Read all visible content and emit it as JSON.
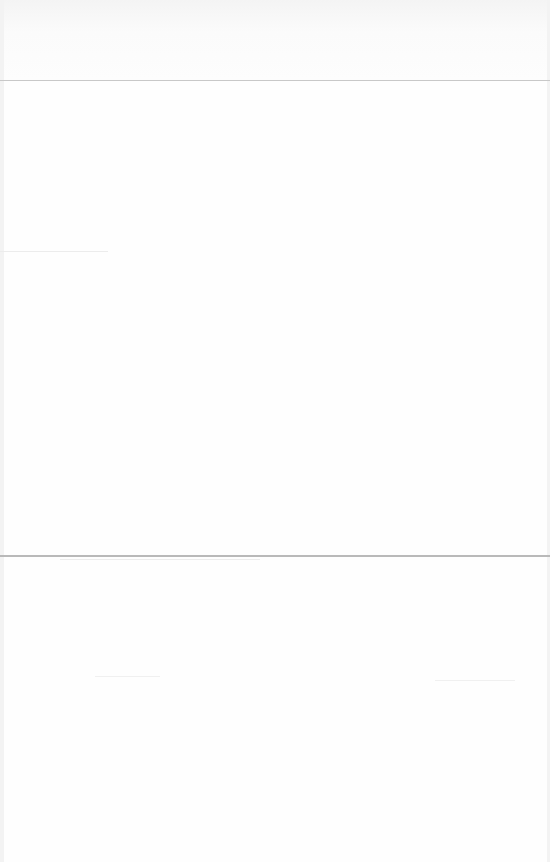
{
  "page": {
    "sections": [
      {
        "name": "header-band",
        "text": ""
      },
      {
        "name": "upper-panel",
        "text": ""
      },
      {
        "name": "lower-panel",
        "text": ""
      }
    ]
  }
}
